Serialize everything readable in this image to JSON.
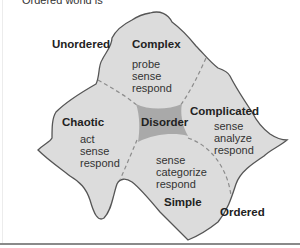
{
  "caption": {
    "partial_text": "Ordered world is"
  },
  "regions": {
    "unordered": "Unordered",
    "ordered": "Ordered"
  },
  "domains": {
    "complex": {
      "title": "Complex",
      "actions": [
        "probe",
        "sense",
        "respond"
      ]
    },
    "complicated": {
      "title": "Complicated",
      "actions": [
        "sense",
        "analyze",
        "respond"
      ]
    },
    "chaotic": {
      "title": "Chaotic",
      "actions": [
        "act",
        "sense",
        "respond"
      ]
    },
    "simple": {
      "title": "Simple",
      "actions": [
        "sense",
        "categorize",
        "respond"
      ]
    },
    "disorder": {
      "title": "Disorder"
    }
  },
  "colors": {
    "shape_fill": "#dcdcdc",
    "shape_stroke": "#555555",
    "disorder_fill": "#a9a9a9",
    "divider": "#8c8c8c",
    "bottom_rule": "#8a8a8a"
  }
}
